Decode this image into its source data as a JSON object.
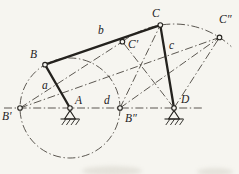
{
  "figure": {
    "canvas": {
      "width": 239,
      "height": 174,
      "background": "#f6f5f0",
      "ink": "#24221e",
      "construction_ink": "#49453e"
    },
    "points": {
      "A": [
        70,
        108
      ],
      "B": [
        45,
        64.7
      ],
      "C": [
        160.3,
        25.1
      ],
      "D": [
        174,
        108
      ],
      "Bp": [
        20,
        108
      ],
      "Bpp": [
        120,
        108
      ],
      "Cp": [
        122.4,
        41.7
      ],
      "Cpp": [
        219.5,
        37.4
      ]
    },
    "links": [
      {
        "name": "link-a-crank",
        "from": "A",
        "to": "B"
      },
      {
        "name": "link-b-coupler",
        "from": "B",
        "to": "C"
      },
      {
        "name": "link-c-rocker",
        "from": "C",
        "to": "D"
      }
    ],
    "ground_line": {
      "name": "frame-line",
      "x1": 4,
      "y1": 108,
      "x2": 203,
      "y2": 108
    },
    "construction_lines": [
      {
        "name": "line-Bprime-Cprime",
        "from": "Bp",
        "to": "Cp"
      },
      {
        "name": "line-Bprime-Cdoubleprime",
        "from": "Bp",
        "to": "Cpp"
      },
      {
        "name": "line-Bdblprime-Cdoubleprime",
        "from": "Bpp",
        "to": "Cpp"
      },
      {
        "name": "line-Bdblprime-C",
        "from": "Bpp",
        "to": "C"
      },
      {
        "name": "line-D-Cprime",
        "from": "D",
        "to": "Cp"
      },
      {
        "name": "line-D-Cdoubleprime",
        "from": "D",
        "to": "Cpp"
      }
    ],
    "circles": [
      {
        "name": "crank-circle",
        "center": "A",
        "r": 50
      }
    ],
    "arcs": [
      {
        "name": "coupler-point-path-arc",
        "path": "M 122.4 41.7 A 84 84 0 0 1 231.3 46.6"
      }
    ],
    "pivots": [
      "A",
      "D"
    ],
    "joint_markers": [
      "A",
      "B",
      "C",
      "D",
      "Bp",
      "Bpp",
      "Cp",
      "Cpp"
    ],
    "labels": [
      {
        "name": "label-A",
        "text": "A",
        "x": 75,
        "y": 104
      },
      {
        "name": "label-B",
        "text": "B",
        "x": 30,
        "y": 58
      },
      {
        "name": "label-C",
        "text": "C",
        "x": 152,
        "y": 17
      },
      {
        "name": "label-D",
        "text": "D",
        "x": 181,
        "y": 103
      },
      {
        "name": "label-B-prime",
        "text": "B′",
        "x": 2,
        "y": 120
      },
      {
        "name": "label-B-double-prime",
        "text": "B″",
        "x": 125,
        "y": 122
      },
      {
        "name": "label-C-prime",
        "text": "C′",
        "x": 128,
        "y": 48
      },
      {
        "name": "label-C-double-prime",
        "text": "C″",
        "x": 219,
        "y": 23
      },
      {
        "name": "label-a",
        "text": "a",
        "x": 42,
        "y": 89
      },
      {
        "name": "label-b",
        "text": "b",
        "x": 98,
        "y": 34
      },
      {
        "name": "label-c",
        "text": "c",
        "x": 169,
        "y": 49
      },
      {
        "name": "label-d",
        "text": "d",
        "x": 104,
        "y": 104
      }
    ],
    "smudges": [
      {
        "cx": 112,
        "cy": 171,
        "rx": 30,
        "ry": 5
      },
      {
        "cx": 215,
        "cy": 172,
        "rx": 18,
        "ry": 4
      }
    ]
  }
}
